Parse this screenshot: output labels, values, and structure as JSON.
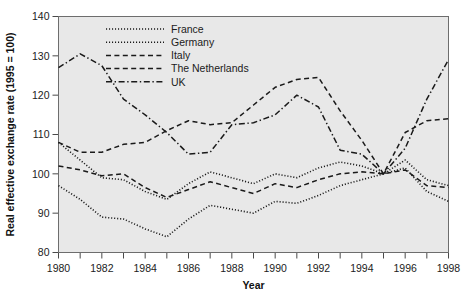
{
  "chart_data": {
    "type": "line",
    "title": "",
    "xlabel": "Year",
    "ylabel": "Real effective exchange rate (1995 = 100)",
    "xlim": [
      1980,
      1998
    ],
    "ylim": [
      80,
      140
    ],
    "ytick_values": [
      80,
      90,
      100,
      110,
      120,
      130,
      140
    ],
    "ytick_labels": [
      "80",
      "90",
      "100",
      "110",
      "120",
      "130",
      "140"
    ],
    "xtick_values": [
      1980,
      1981,
      1982,
      1983,
      1984,
      1985,
      1986,
      1987,
      1988,
      1989,
      1990,
      1991,
      1992,
      1993,
      1994,
      1995,
      1996,
      1997,
      1998
    ],
    "xtick_labels_shown": [
      "1980",
      "1982",
      "1984",
      "1986",
      "1988",
      "1990",
      "1992",
      "1994",
      "1996",
      "1998"
    ],
    "grid": false,
    "legend_position": "top-center",
    "x": [
      1980,
      1981,
      1982,
      1983,
      1984,
      1985,
      1986,
      1987,
      1988,
      1989,
      1990,
      1991,
      1992,
      1993,
      1994,
      1995,
      1996,
      1997,
      1998
    ],
    "series": [
      {
        "name": "France",
        "style": "dotted",
        "values": [
          97.0,
          93.5,
          89.0,
          88.5,
          86.0,
          84.0,
          88.5,
          92.0,
          91.0,
          90.0,
          93.0,
          92.5,
          94.5,
          97.0,
          98.5,
          100.0,
          101.5,
          95.5,
          93.0
        ]
      },
      {
        "name": "Germany",
        "style": "dotted",
        "values": [
          108.0,
          103.5,
          99.0,
          98.5,
          95.5,
          93.5,
          97.5,
          100.5,
          99.0,
          97.5,
          100.0,
          99.0,
          101.5,
          103.0,
          102.0,
          100.0,
          103.5,
          98.5,
          97.0
        ]
      },
      {
        "name": "Italy",
        "style": "dashed",
        "values": [
          108.0,
          105.5,
          105.5,
          107.5,
          108.0,
          111.0,
          113.5,
          112.5,
          113.0,
          117.5,
          122.0,
          124.0,
          124.5,
          116.0,
          108.5,
          100.0,
          110.5,
          113.5,
          114.0
        ]
      },
      {
        "name": "The Netherlands",
        "style": "dashed",
        "values": [
          102.0,
          101.0,
          99.5,
          100.0,
          96.5,
          94.0,
          96.0,
          98.0,
          96.5,
          95.0,
          97.5,
          96.5,
          98.5,
          100.0,
          100.5,
          100.0,
          101.0,
          97.0,
          96.5
        ]
      },
      {
        "name": "UK",
        "style": "dash-dot",
        "values": [
          127.0,
          130.5,
          127.5,
          119.0,
          115.0,
          110.5,
          105.0,
          105.5,
          112.5,
          113.0,
          115.0,
          120.0,
          117.0,
          106.0,
          105.0,
          100.0,
          106.5,
          119.0,
          129.0
        ]
      }
    ]
  },
  "legend": {
    "items": [
      {
        "label": "France"
      },
      {
        "label": "Germany"
      },
      {
        "label": "Italy"
      },
      {
        "label": "The Netherlands"
      },
      {
        "label": "UK"
      }
    ]
  }
}
